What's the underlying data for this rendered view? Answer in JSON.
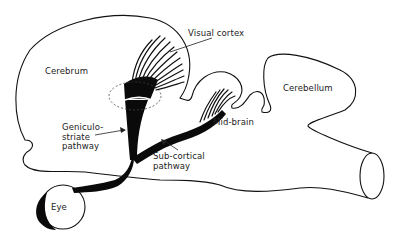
{
  "diagram": {
    "type": "anatomical-schematic",
    "labels": {
      "cerebrum": "Cerebrum",
      "visual_cortex": "Visual cortex",
      "cerebellum": "Cerebellum",
      "mid_brain": "Mid-brain",
      "geniculo_striate": "Geniculo-\nstriate\npathway",
      "sub_cortical": "Sub-cortical\npathway",
      "eye": "Eye"
    },
    "nodes": [
      {
        "id": "eye",
        "label": "Eye"
      },
      {
        "id": "cerebrum",
        "label": "Cerebrum"
      },
      {
        "id": "visual_cortex",
        "label": "Visual cortex"
      },
      {
        "id": "mid_brain",
        "label": "Mid-brain"
      },
      {
        "id": "cerebellum",
        "label": "Cerebellum"
      }
    ],
    "edges": [
      {
        "from": "eye",
        "to": "visual_cortex",
        "label": "Geniculo-striate pathway"
      },
      {
        "from": "eye",
        "to": "mid_brain",
        "label": "Sub-cortical pathway"
      }
    ],
    "colors": {
      "ink": "#111111",
      "background": "#ffffff"
    }
  }
}
